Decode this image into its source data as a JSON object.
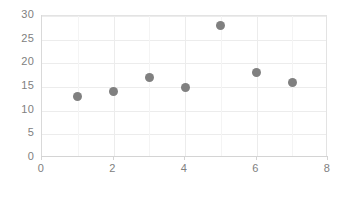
{
  "chart_data": {
    "type": "scatter",
    "title": "",
    "subtitle": "",
    "xlabel": "",
    "ylabel": "",
    "xlim": [
      0,
      8
    ],
    "ylim": [
      0,
      30
    ],
    "grid": true,
    "legend": "none",
    "series": [
      {
        "name": "",
        "marker": "circle",
        "color": "#808080",
        "points": [
          {
            "x": 1,
            "y": 13
          },
          {
            "x": 2,
            "y": 14
          },
          {
            "x": 3,
            "y": 17
          },
          {
            "x": 4,
            "y": 15
          },
          {
            "x": 5,
            "y": 28
          },
          {
            "x": 6,
            "y": 18
          },
          {
            "x": 7,
            "y": 16
          }
        ]
      }
    ],
    "x_ticks": [
      0,
      2,
      4,
      6,
      8
    ],
    "x_minor_gridlines": [
      1,
      3,
      5,
      7
    ],
    "y_ticks": [
      0,
      5,
      10,
      15,
      20,
      25,
      30
    ],
    "x_tick_labels": [
      "0",
      "2",
      "4",
      "6",
      "8"
    ],
    "y_tick_labels": [
      "0",
      "5",
      "10",
      "15",
      "20",
      "25",
      "30"
    ]
  },
  "colors": {
    "marker": "#808080",
    "gridline": "#ececec",
    "gridline_minor": "#f4f4f4",
    "axis": "#d4d4d4",
    "tick_label": "#808080",
    "plot_background": "#ffffff",
    "plot_border": "#e3e3e3"
  }
}
